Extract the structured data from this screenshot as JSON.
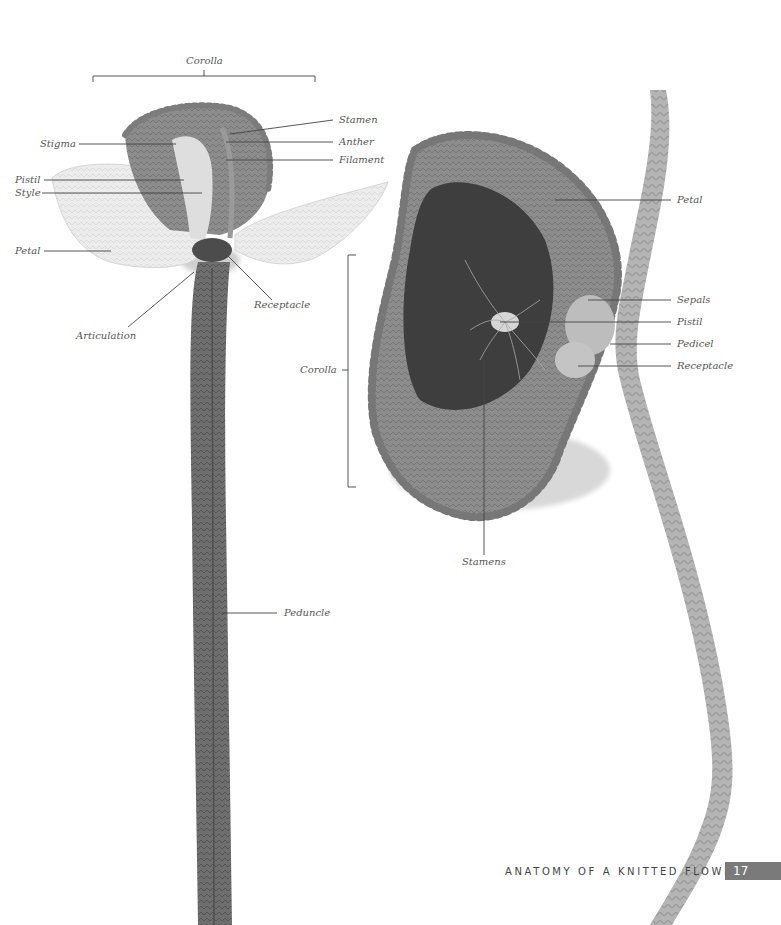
{
  "page": {
    "footer_title": "ANATOMY OF A KNITTED FLOWER",
    "page_number": "17",
    "colors": {
      "background": "#ffffff",
      "label_text": "#555555",
      "leader_line": "#444444",
      "page_tab": "#7a7a7a",
      "yarn_light": "#e4e4e4",
      "yarn_mid": "#8a8a8a",
      "yarn_dark": "#4a4a4a"
    }
  },
  "left_flower": {
    "corolla_bracket_label": "Corolla",
    "labels": {
      "stamen": "Stamen",
      "anther": "Anther",
      "filament": "Filament",
      "stigma": "Stigma",
      "pistil": "Pistil",
      "style": "Style",
      "petal": "Petal",
      "receptacle": "Receptacle",
      "articulation": "Articulation",
      "peduncle": "Peduncle"
    }
  },
  "right_flower": {
    "corolla_bracket_label": "Corolla",
    "labels": {
      "petal": "Petal",
      "sepals": "Sepals",
      "pistil": "Pistil",
      "pedicel": "Pedicel",
      "receptacle": "Receptacle",
      "stamens": "Stamens"
    }
  }
}
